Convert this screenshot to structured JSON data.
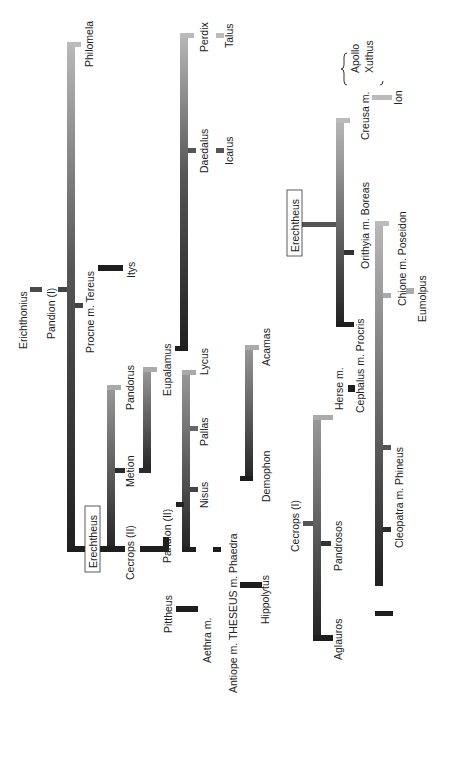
{
  "legend": {
    "title_lines": [
      "The five",
      "traditional kings",
      "of Athens:"
    ],
    "kings": [
      "Cecrops",
      "Erichthonius",
      "Erechtheus",
      "Pandion",
      "Aegeus"
    ]
  },
  "people": {
    "erichthonius": "Erichthonius",
    "pandion_1": "Pandion (I)",
    "philomela": "Philomela",
    "procne": "Procne m. Tereus",
    "itys": "Itys",
    "erechtheus_main": "Erechtheus",
    "cecrops_2": "Cecrops (II)",
    "metion": "Metion",
    "pandorus": "Pandorus",
    "eupalamus": "Eupalamus",
    "perdix": "Perdix",
    "talus": "Talus",
    "daedalus": "Daedalus",
    "icarus": "Icarus",
    "pandion_2": "Pandion (II)",
    "nisus": "Nisus",
    "pallas": "Pallas",
    "lycus": "Lycus",
    "pittheus": "Pittheus",
    "aethra": "Aethra m.",
    "theseus": "Antiope m. THESEUS m. Phaedra",
    "hippolytus": "Hippolytus",
    "demophon": "Demophon",
    "acamas": "Acamas",
    "cecrops_1": "Cecrops (I)",
    "aglauros": "Aglauros",
    "pandrosos": "Pandrosos",
    "herse": "Herse m.",
    "cephalus": "Cephalus m. Procris",
    "erechtheus_2": "Erechtheus",
    "orithyia": "Orithyia m. Boreas",
    "creusa": "Creusa m.",
    "apollo": "Apollo",
    "xuthus": "Xuthus",
    "ion": "Ion",
    "chione": "Chione m. Poseidon",
    "eumolpus": "Eumolpus",
    "cleopatra": "Cleopatra m. Phineus",
    "calais": "Calaïs",
    "zetes": "Zetes"
  },
  "colors": {
    "dark": "#1e1e1e",
    "mid": "#5a5a5a",
    "light": "#b4b4b4"
  }
}
